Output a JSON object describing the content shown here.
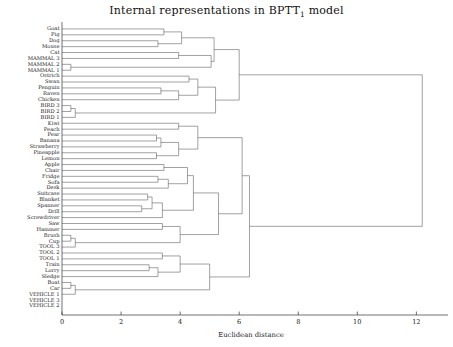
{
  "chart_data": {
    "type": "dendrogram",
    "title": "Internal representations in BPTT",
    "title_subscript": "1",
    "title_suffix": " model",
    "xlabel": "Euclidean distance",
    "ylabel": "",
    "xlim": [
      0,
      12.8
    ],
    "xticks": [
      0,
      2,
      4,
      6,
      8,
      10,
      12
    ],
    "xticklabels": [
      "0",
      "2",
      "4",
      "6",
      "8",
      "10",
      "12"
    ],
    "grid": false,
    "legend": null,
    "orientation": "horizontal-right",
    "leaves": [
      "Goat",
      "Pig",
      "Dog",
      "Mouse",
      "Cat",
      "MAMMAL 3",
      "MAMMAL 2",
      "MAMMAL 1",
      "Ostrich",
      "Swan",
      "Penguin",
      "Raven",
      "Chicken",
      "BIRD 3",
      "BIRD 2",
      "BIRD 1",
      "Kiwi",
      "Peach",
      "Pear",
      "Banana",
      "Strawberry",
      "Pineapple",
      "Lemon",
      "Apple",
      "Chair",
      "Fridge",
      "Sofa",
      "Desk",
      "Suitcase",
      "Blanket",
      "Spanner",
      "Drill",
      "Screwdriver",
      "Saw",
      "Hammer",
      "Brush",
      "Cup",
      "TOOL 3",
      "TOOL 2",
      "TOOL 1",
      "Train",
      "Lorry",
      "Sledge",
      "Boat",
      "Car",
      "VEHICLE 1",
      "VEHICLE 3",
      "VEHICLE 2"
    ],
    "merges": [
      {
        "id": "m1",
        "a": {
          "leaf": 0
        },
        "b": {
          "leaf": 1
        },
        "height": 3.45
      },
      {
        "id": "m2",
        "a": {
          "leaf": 2
        },
        "b": {
          "leaf": 3
        },
        "height": 3.25
      },
      {
        "id": "m3",
        "a": "m1",
        "b": "m2",
        "height": 4.05
      },
      {
        "id": "m4",
        "a": {
          "leaf": 4
        },
        "b": {
          "leaf": 5
        },
        "height": 3.95
      },
      {
        "id": "m5",
        "a": {
          "leaf": 6
        },
        "b": {
          "leaf": 7
        },
        "height": 0.3
      },
      {
        "id": "m6",
        "a": "m4",
        "b": "m5",
        "height": 5.05
      },
      {
        "id": "m7",
        "a": "m3",
        "b": "m6",
        "height": 5.15
      },
      {
        "id": "m8",
        "a": {
          "leaf": 8
        },
        "b": {
          "leaf": 9
        },
        "height": 4.3
      },
      {
        "id": "m9",
        "a": {
          "leaf": 10
        },
        "b": {
          "leaf": 11
        },
        "height": 3.35
      },
      {
        "id": "m10",
        "a": "m9",
        "b": {
          "leaf": 12
        },
        "height": 3.95
      },
      {
        "id": "m11",
        "a": "m8",
        "b": "m10",
        "height": 4.6
      },
      {
        "id": "m12",
        "a": {
          "leaf": 13
        },
        "b": {
          "leaf": 14
        },
        "height": 0.3
      },
      {
        "id": "m13",
        "a": "m12",
        "b": {
          "leaf": 15
        },
        "height": 0.45
      },
      {
        "id": "m14",
        "a": "m11",
        "b": "m13",
        "height": 5.2
      },
      {
        "id": "m15",
        "a": "m7",
        "b": "m14",
        "height": 6.0
      },
      {
        "id": "m16",
        "a": {
          "leaf": 16
        },
        "b": {
          "leaf": 17
        },
        "height": 3.95
      },
      {
        "id": "m17",
        "a": {
          "leaf": 18
        },
        "b": {
          "leaf": 19
        },
        "height": 3.2
      },
      {
        "id": "m18",
        "a": "m17",
        "b": {
          "leaf": 20
        },
        "height": 3.35
      },
      {
        "id": "m19",
        "a": {
          "leaf": 21
        },
        "b": {
          "leaf": 22
        },
        "height": 3.2
      },
      {
        "id": "m20",
        "a": "m18",
        "b": "m19",
        "height": 3.95
      },
      {
        "id": "m21",
        "a": "m16",
        "b": "m20",
        "height": 4.6
      },
      {
        "id": "m22",
        "a": {
          "leaf": 23
        },
        "b": {
          "leaf": 24
        },
        "height": 3.45
      },
      {
        "id": "m23",
        "a": {
          "leaf": 25
        },
        "b": {
          "leaf": 26
        },
        "height": 3.25
      },
      {
        "id": "m24",
        "a": "m23",
        "b": {
          "leaf": 27
        },
        "height": 3.6
      },
      {
        "id": "m25",
        "a": "m22",
        "b": "m24",
        "height": 4.25
      },
      {
        "id": "m26",
        "a": {
          "leaf": 28
        },
        "b": {
          "leaf": 29
        },
        "height": 2.9
      },
      {
        "id": "m27",
        "a": {
          "leaf": 30
        },
        "b": {
          "leaf": 31
        },
        "height": 2.7
      },
      {
        "id": "m28",
        "a": "m26",
        "b": "m27",
        "height": 3.05
      },
      {
        "id": "m29",
        "a": "m28",
        "b": {
          "leaf": 32
        },
        "height": 3.4
      },
      {
        "id": "m30",
        "a": "m25",
        "b": "m29",
        "height": 4.45
      },
      {
        "id": "m31",
        "a": {
          "leaf": 33
        },
        "b": {
          "leaf": 34
        },
        "height": 3.4
      },
      {
        "id": "m32",
        "a": {
          "leaf": 35
        },
        "b": {
          "leaf": 36
        },
        "height": 0.3
      },
      {
        "id": "m33",
        "a": "m32",
        "b": {
          "leaf": 37
        },
        "height": 0.45
      },
      {
        "id": "m34",
        "a": "m31",
        "b": "m33",
        "height": 4.0
      },
      {
        "id": "m35",
        "a": "m30",
        "b": "m34",
        "height": 5.3
      },
      {
        "id": "m36",
        "a": "m21",
        "b": "m35",
        "height": 6.1
      },
      {
        "id": "m37",
        "a": {
          "leaf": 38
        },
        "b": {
          "leaf": 39
        },
        "height": 3.4
      },
      {
        "id": "m38",
        "a": {
          "leaf": 40
        },
        "b": {
          "leaf": 41
        },
        "height": 2.95
      },
      {
        "id": "m39",
        "a": "m38",
        "b": {
          "leaf": 42
        },
        "height": 3.25
      },
      {
        "id": "m40",
        "a": "m37",
        "b": "m39",
        "height": 4.0
      },
      {
        "id": "m41",
        "a": {
          "leaf": 43
        },
        "b": {
          "leaf": 44
        },
        "height": 0.3
      },
      {
        "id": "m42",
        "a": "m41",
        "b": {
          "leaf": 45
        },
        "height": 0.45
      },
      {
        "id": "m43",
        "a": "m40",
        "b": "m42",
        "height": 5.0
      },
      {
        "id": "m44",
        "a": "m36",
        "b": "m43",
        "height": 6.35
      },
      {
        "id": "m45",
        "a": "m15",
        "b": "m44",
        "height": 12.2
      }
    ],
    "root": "m45"
  }
}
